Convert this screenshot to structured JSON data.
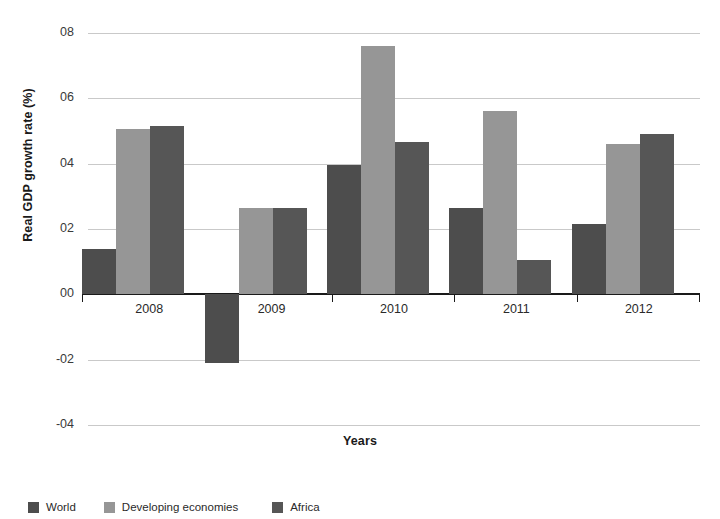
{
  "chart_data": {
    "type": "bar",
    "title": "",
    "subtitle": "",
    "xlabel": "Years",
    "ylabel": "Real GDP growth rate (%)",
    "categories": [
      "2008",
      "2009",
      "2010",
      "2011",
      "2012"
    ],
    "series": [
      {
        "name": "World",
        "color": "#4d4d4d",
        "values": [
          1.4,
          -2.1,
          3.95,
          2.65,
          2.15
        ]
      },
      {
        "name": "Developing economies",
        "color": "#969696",
        "values": [
          5.05,
          2.65,
          7.6,
          5.6,
          4.6
        ]
      },
      {
        "name": "Africa",
        "color": "#565656",
        "values": [
          5.15,
          2.65,
          4.65,
          1.05,
          4.9
        ]
      }
    ],
    "ylim": [
      -4,
      8
    ],
    "yticks": [
      8,
      6,
      4,
      2,
      0,
      -2,
      -4
    ],
    "ytick_labels": [
      "08",
      "06",
      "04",
      "02",
      "00",
      "-02",
      "-04"
    ],
    "grid": true,
    "legend_position": "bottom-left",
    "zero_line": true
  },
  "axis": {
    "y_title": "Real GDP growth rate (%)",
    "x_title": "Years"
  },
  "legend": {
    "items": [
      {
        "label": "World",
        "color": "#4d4d4d"
      },
      {
        "label": "Developing economies",
        "color": "#969696"
      },
      {
        "label": "Africa",
        "color": "#565656"
      }
    ]
  }
}
